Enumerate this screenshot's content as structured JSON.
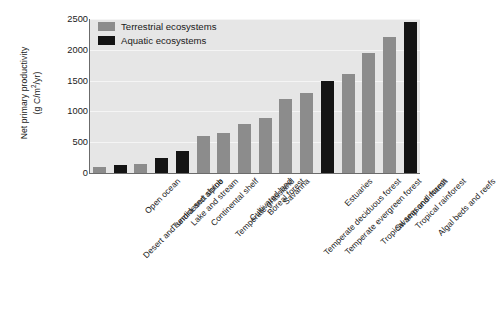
{
  "chart_data": {
    "type": "bar",
    "title": "",
    "xlabel": "",
    "ylabel_line1": "Net primary productivity",
    "ylabel_line2_pre": "(g C/m",
    "ylabel_line2_sup": "2",
    "ylabel_line2_post": "/yr)",
    "ylim": [
      0,
      2500
    ],
    "yticks": [
      0,
      500,
      1000,
      1500,
      2000,
      2500
    ],
    "ytick_labels": [
      "0",
      "500",
      "1000",
      "1500",
      "2000",
      "2500"
    ],
    "grid": true,
    "legend_position": "top-left",
    "legend": [
      {
        "label": "Terrestrial ecosystems",
        "color": "#8c8c8c",
        "key": "terrestrial"
      },
      {
        "label": "Aquatic ecosystems",
        "color": "#141414",
        "key": "aquatic"
      }
    ],
    "categories": [
      "Desert and semidesert shrub",
      "Open ocean",
      "Tundra and alpine",
      "Lake and stream",
      "Continental shelf",
      "Temperate grassland",
      "Cultivated land",
      "Boreal forest",
      "Savanna",
      "Temperate deciduous forest",
      "Temperate evergreen forest",
      "Estuaries",
      "Tropical seasonal forest",
      "Swamp and marsh",
      "Tropical rainforest",
      "Algal beds and reefs"
    ],
    "values": [
      90,
      125,
      140,
      250,
      360,
      600,
      650,
      800,
      900,
      1200,
      1300,
      1500,
      1600,
      1950,
      2200,
      2450
    ],
    "types": [
      "terrestrial",
      "aquatic",
      "terrestrial",
      "aquatic",
      "aquatic",
      "terrestrial",
      "terrestrial",
      "terrestrial",
      "terrestrial",
      "terrestrial",
      "terrestrial",
      "aquatic",
      "terrestrial",
      "terrestrial",
      "terrestrial",
      "aquatic"
    ]
  }
}
